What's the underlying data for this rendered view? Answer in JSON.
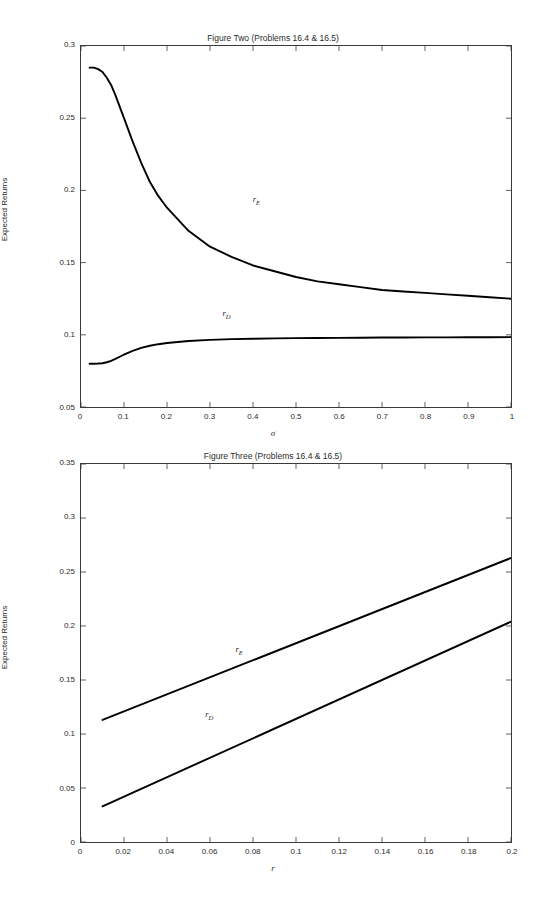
{
  "page_header": "",
  "figures": [
    {
      "id": "figure-two",
      "title": "Figure Two (Problems 16.4 & 16.5)",
      "ylabel": "Expected Returns",
      "xlabel": "σ",
      "series_labels": {
        "rE": "r",
        "rE_sub": "E",
        "rD": "r",
        "rD_sub": "D"
      }
    },
    {
      "id": "figure-three",
      "title": "Figure Three (Problems 16.4 & 16.5)",
      "ylabel": "Expected Returns",
      "xlabel": "r",
      "series_labels": {
        "rE": "r",
        "rE_sub": "E",
        "rD": "r",
        "rD_sub": "D"
      }
    }
  ],
  "chart_data": [
    {
      "type": "line",
      "title": "Figure Two (Problems 16.4 & 16.5)",
      "xlabel": "σ",
      "ylabel": "Expected Returns",
      "xlim": [
        0,
        1
      ],
      "ylim": [
        0.05,
        0.3
      ],
      "xticks": [
        0,
        0.1,
        0.2,
        0.3,
        0.4,
        0.5,
        0.6,
        0.7,
        0.8,
        0.9,
        1
      ],
      "xtick_labels": [
        "0",
        "0.1",
        "0.2",
        "0.3",
        "0.4",
        "0.5",
        "0.6",
        "0.7",
        "0.8",
        "0.9",
        "1"
      ],
      "yticks": [
        0.05,
        0.1,
        0.15,
        0.2,
        0.25,
        0.3
      ],
      "ytick_labels": [
        "0.05",
        "0.1",
        "0.15",
        "0.2",
        "0.25",
        "0.3"
      ],
      "grid": false,
      "legend": "none",
      "annotations": [
        {
          "text": "rE",
          "x": 0.4,
          "y": 0.193
        },
        {
          "text": "rD",
          "x": 0.33,
          "y": 0.115
        }
      ],
      "series": [
        {
          "name": "rE",
          "color": "#000000",
          "x": [
            0.02,
            0.03,
            0.04,
            0.05,
            0.06,
            0.07,
            0.08,
            0.09,
            0.1,
            0.12,
            0.14,
            0.16,
            0.18,
            0.2,
            0.25,
            0.3,
            0.35,
            0.4,
            0.45,
            0.5,
            0.55,
            0.6,
            0.65,
            0.7,
            0.75,
            0.8,
            0.85,
            0.9,
            0.95,
            1.0
          ],
          "values": [
            0.285,
            0.285,
            0.284,
            0.282,
            0.278,
            0.273,
            0.266,
            0.258,
            0.25,
            0.234,
            0.219,
            0.206,
            0.196,
            0.188,
            0.172,
            0.161,
            0.154,
            0.148,
            0.144,
            0.14,
            0.137,
            0.135,
            0.133,
            0.131,
            0.13,
            0.129,
            0.128,
            0.127,
            0.126,
            0.125
          ]
        },
        {
          "name": "rD",
          "color": "#000000",
          "x": [
            0.02,
            0.03,
            0.04,
            0.05,
            0.06,
            0.07,
            0.08,
            0.09,
            0.1,
            0.12,
            0.14,
            0.16,
            0.18,
            0.2,
            0.25,
            0.3,
            0.35,
            0.4,
            0.45,
            0.5,
            0.55,
            0.6,
            0.65,
            0.7,
            0.75,
            0.8,
            0.85,
            0.9,
            0.95,
            1.0
          ],
          "values": [
            0.08,
            0.08,
            0.0801,
            0.0803,
            0.081,
            0.082,
            0.0833,
            0.0848,
            0.0862,
            0.0889,
            0.0909,
            0.0924,
            0.0935,
            0.0943,
            0.0957,
            0.0965,
            0.097,
            0.0973,
            0.0975,
            0.0977,
            0.0978,
            0.0979,
            0.098,
            0.0981,
            0.0981,
            0.0982,
            0.0982,
            0.0983,
            0.0983,
            0.0984
          ]
        }
      ]
    },
    {
      "type": "line",
      "title": "Figure Three (Problems 16.4 & 16.5)",
      "xlabel": "r",
      "ylabel": "Expected Returns",
      "xlim": [
        0,
        0.2
      ],
      "ylim": [
        0,
        0.35
      ],
      "xticks": [
        0,
        0.02,
        0.04,
        0.06,
        0.08,
        0.1,
        0.12,
        0.14,
        0.16,
        0.18,
        0.2
      ],
      "xtick_labels": [
        "0",
        "0.02",
        "0.04",
        "0.06",
        "0.08",
        "0.1",
        "0.12",
        "0.14",
        "0.16",
        "0.18",
        "0.2"
      ],
      "yticks": [
        0,
        0.05,
        0.1,
        0.15,
        0.2,
        0.25,
        0.3,
        0.35
      ],
      "ytick_labels": [
        "0",
        "0.05",
        "0.1",
        "0.15",
        "0.2",
        "0.25",
        "0.3",
        "0.35"
      ],
      "grid": false,
      "legend": "none",
      "annotations": [
        {
          "text": "rE",
          "x": 0.072,
          "y": 0.178
        },
        {
          "text": "rD",
          "x": 0.058,
          "y": 0.118
        }
      ],
      "series": [
        {
          "name": "rE",
          "color": "#000000",
          "x": [
            0.01,
            0.2
          ],
          "values": [
            0.113,
            0.263
          ]
        },
        {
          "name": "rD",
          "color": "#000000",
          "x": [
            0.01,
            0.2
          ],
          "values": [
            0.033,
            0.204
          ]
        }
      ]
    }
  ]
}
